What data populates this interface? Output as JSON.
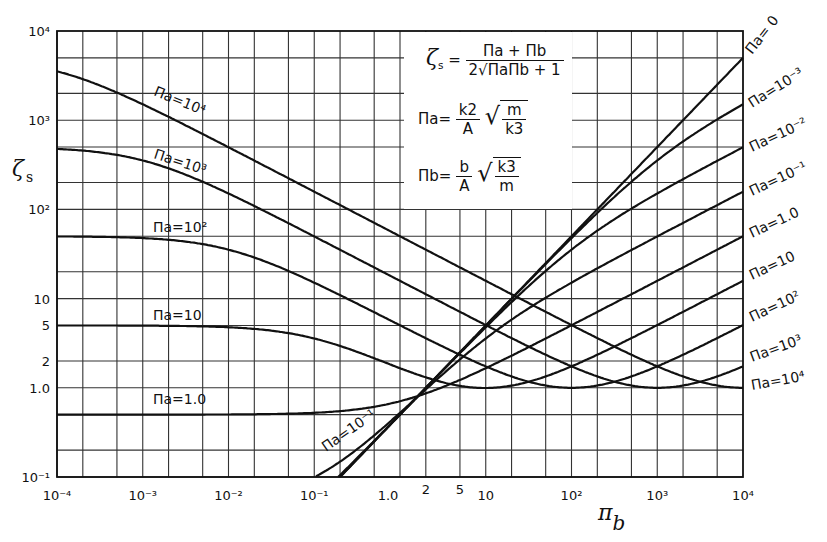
{
  "chart_data": {
    "type": "line",
    "title": "",
    "xlabel": "Πb",
    "ylabel": "ζs",
    "xscale": "log",
    "yscale": "log",
    "xlim": [
      0.0001,
      10000
    ],
    "ylim": [
      0.1,
      10000
    ],
    "grid": true,
    "x_ticks": [
      "10⁻⁴",
      "10⁻³",
      "10⁻²",
      "10⁻¹",
      "1.0",
      "2",
      "5",
      "10",
      "10²",
      "10³",
      "10⁴"
    ],
    "y_ticks": [
      "10⁴",
      "10³",
      "10²",
      "10",
      "5",
      "2",
      "1.0",
      "10⁻¹"
    ],
    "formula": "ζs = (Πa + Πb) / (2·sqrt(Πa·Πb + 1))",
    "x": [
      0.0001,
      0.001,
      0.01,
      0.1,
      1,
      10,
      100,
      1000,
      10000
    ],
    "series": [
      {
        "name": "Πa = 0",
        "pi_a": 0,
        "values": [
          5e-05,
          0.0005,
          0.005,
          0.05,
          0.5,
          5,
          50,
          500,
          5000
        ]
      },
      {
        "name": "Πa = 10⁻³",
        "pi_a": 0.001,
        "values": [
          0.00055,
          0.001,
          0.0055,
          0.05,
          0.5,
          4.98,
          47.7,
          354,
          1508
        ]
      },
      {
        "name": "Πa = 10⁻²",
        "pi_a": 0.01,
        "values": [
          0.005,
          0.0055,
          0.01,
          0.055,
          0.5,
          4.55,
          35.4,
          151,
          497
        ]
      },
      {
        "name": "Πa = 10⁻¹",
        "pi_a": 0.1,
        "values": [
          0.05,
          0.05,
          0.055,
          0.1,
          0.52,
          3.57,
          15.1,
          49.8,
          158
        ]
      },
      {
        "name": "Πa = 1.0",
        "pi_a": 1,
        "values": [
          0.5,
          0.5,
          0.5,
          0.52,
          0.707,
          1.66,
          5.02,
          15.8,
          50
        ]
      },
      {
        "name": "Πa = 10",
        "pi_a": 10,
        "values": [
          5,
          5,
          4.98,
          3.57,
          1.66,
          0.995,
          1.74,
          5.02,
          15.8
        ]
      },
      {
        "name": "Πa = 10²",
        "pi_a": 100,
        "values": [
          50,
          50,
          35.4,
          15.1,
          5.02,
          1.74,
          1.0,
          1.74,
          5.02
        ]
      },
      {
        "name": "Πa = 10³",
        "pi_a": 1000,
        "values": [
          500,
          354,
          151,
          49.8,
          15.8,
          5.02,
          1.74,
          1.0,
          1.74
        ]
      },
      {
        "name": "Πa = 10⁴",
        "pi_a": 10000,
        "values": [
          3536,
          1508,
          497,
          158,
          50,
          15.8,
          5.02,
          1.74,
          1.0
        ]
      }
    ],
    "annotations": [
      "ζs = (Πa + Πb) / (2√(ΠaΠb + 1))",
      "Πa = (k2/A)·√(m/k3)",
      "Πb = (b/A)·√(k3/m)"
    ],
    "legend_position": "inline labels; right edge"
  },
  "labels": {
    "y_title": "ζ",
    "y_title_sub": "s",
    "x_title": "π",
    "x_title_sub": "b",
    "curve_labels_left": [
      {
        "text": "Πa=10⁴",
        "x": 153,
        "y": 95,
        "rot": 22
      },
      {
        "text": "Πa=10³",
        "x": 153,
        "y": 158,
        "rot": 18
      },
      {
        "text": "Πa=10²",
        "x": 153,
        "y": 232,
        "rot": 0
      },
      {
        "text": "Πa=10",
        "x": 153,
        "y": 320,
        "rot": 0
      },
      {
        "text": "Πa=1.0",
        "x": 153,
        "y": 404,
        "rot": 0
      },
      {
        "text": "Πa=10⁻¹",
        "x": 326,
        "y": 452,
        "rot": -35
      }
    ],
    "curve_labels_right": [
      {
        "text": "Πa= 0",
        "x": 752,
        "y": 55,
        "rot": -52
      },
      {
        "text": "Πa=10⁻³",
        "x": 752,
        "y": 108,
        "rot": -32
      },
      {
        "text": "Πa=10⁻²",
        "x": 752,
        "y": 152,
        "rot": -25
      },
      {
        "text": "Πa=10⁻¹",
        "x": 752,
        "y": 196,
        "rot": -25
      },
      {
        "text": "Πa=1.0",
        "x": 752,
        "y": 238,
        "rot": -25
      },
      {
        "text": "Πa=10",
        "x": 752,
        "y": 280,
        "rot": -25
      },
      {
        "text": "Πa=10²",
        "x": 752,
        "y": 322,
        "rot": -25
      },
      {
        "text": "Πa=10³",
        "x": 752,
        "y": 362,
        "rot": -20
      },
      {
        "text": "Πa=10⁴",
        "x": 752,
        "y": 390,
        "rot": -10
      }
    ]
  },
  "equations": {
    "zeta_lhs": "ζ",
    "zeta_sub": "s",
    "zeta_num": "Πa + Πb",
    "zeta_den_pre": "2",
    "zeta_den_rad": "ΠaΠb + 1",
    "pia_lhs": "Πa",
    "pia_num": "k2",
    "pia_den": "A",
    "pia_rad_num": "m",
    "pia_rad_den": "k3",
    "pib_lhs": "Πb",
    "pib_num": "b",
    "pib_den": "A",
    "pib_rad_num": "k3",
    "pib_rad_den": "m",
    "eq": "="
  }
}
